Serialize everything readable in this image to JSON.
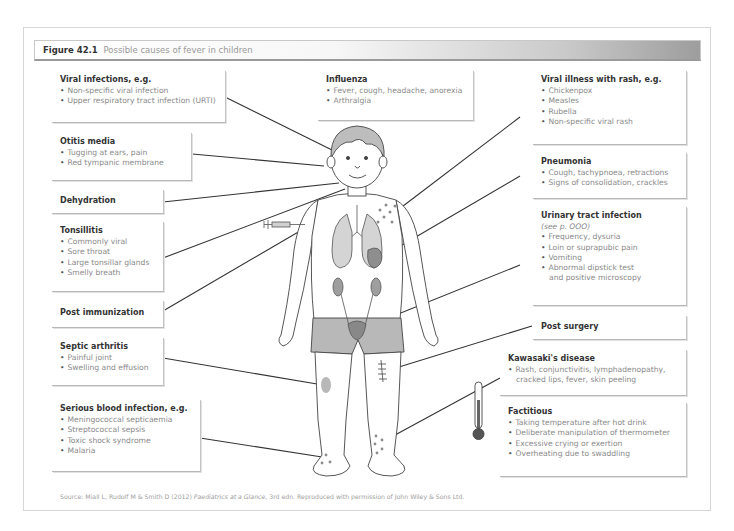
{
  "figure": {
    "number": "Figure 42.1",
    "caption": "Possible causes of fever in children"
  },
  "boxes": {
    "viral_infections": {
      "heading": "Viral infections, e.g.",
      "items": [
        "Non-specific viral infection",
        "Upper respiratory tract infection (URTI)"
      ]
    },
    "influenza": {
      "heading": "Influenza",
      "items": [
        "Fever, cough, headache, anorexia",
        "Arthralgia"
      ]
    },
    "viral_rash": {
      "heading": "Viral illness with rash, e.g.",
      "items": [
        "Chickenpox",
        "Measles",
        "Rubella",
        "Non-specific viral rash"
      ]
    },
    "otitis_media": {
      "heading": "Otitis media",
      "items": [
        "Tugging at ears, pain",
        "Red tympanic membrane"
      ]
    },
    "pneumonia": {
      "heading": "Pneumonia",
      "items": [
        "Cough, tachypnoea, retractions",
        "Signs of consolidation, crackles"
      ]
    },
    "dehydration": {
      "heading": "Dehydration"
    },
    "tonsillitis": {
      "heading": "Tonsillitis",
      "items": [
        "Commonly viral",
        "Sore throat",
        "Large tonsillar glands",
        "Smelly breath"
      ]
    },
    "uti": {
      "heading": "Urinary tract infection",
      "note": "(see p. OOO)",
      "items": [
        "Frequency, dysuria",
        "Loin or suprapubic pain",
        "Vomiting",
        "Abnormal dipstick test"
      ],
      "continuation": "and positive microscopy"
    },
    "post_immunization": {
      "heading": "Post immunization"
    },
    "post_surgery": {
      "heading": "Post surgery"
    },
    "septic_arthritis": {
      "heading": "Septic arthritis",
      "items": [
        "Painful joint",
        "Swelling and effusion"
      ]
    },
    "kawasaki": {
      "heading": "Kawasaki's disease",
      "items": [
        "Rash, conjunctivitis, lymphadenopathy,"
      ],
      "continuation": "cracked lips, fever, skin peeling"
    },
    "blood_infection": {
      "heading": "Serious blood infection, e.g.",
      "items": [
        "Meningococcal septicaemia",
        "Streptococcal sepsis",
        "Toxic shock syndrome",
        "Malaria"
      ]
    },
    "factitious": {
      "heading": "Factitious",
      "items": [
        "Taking temperature after hot drink",
        "Deliberate manipulation of thermometer",
        "Excessive crying or exertion",
        "Overheating due to swaddling"
      ]
    }
  },
  "source": {
    "prefix": "Source: Miall L, Rudolf M & Smith D (2012) ",
    "title": "Paediatrics at a Glance",
    "suffix": ", 3rd edn. Reproduced with permission of John Wiley & Sons Ltd."
  },
  "colors": {
    "body_shading": "#b5b5b5",
    "organ_shading": "#9e9e9e",
    "rash_dots": "#8c8c8c",
    "line": "#333333"
  }
}
